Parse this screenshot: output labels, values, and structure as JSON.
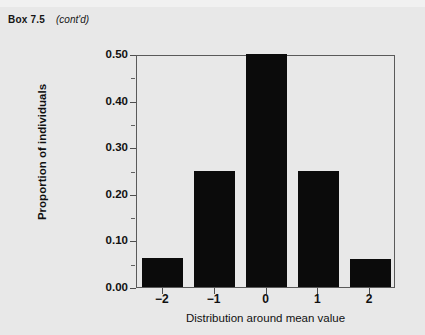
{
  "header": {
    "box_label": "Box 7.5",
    "continued": "(cont'd)"
  },
  "chart_data": {
    "type": "bar",
    "title": "",
    "subtitle": "",
    "categories": [
      "−2",
      "−1",
      "0",
      "1",
      "2"
    ],
    "values": [
      0.0625,
      0.25,
      0.5,
      0.25,
      0.06
    ],
    "xlabel": "Distribution around mean value",
    "ylabel": "Proportion of individuals",
    "ylim": [
      0.0,
      0.5
    ],
    "ytick_labels": [
      "0.00",
      "0.10",
      "0.20",
      "0.30",
      "0.40",
      "0.50"
    ],
    "ytick_values": [
      0.0,
      0.1,
      0.2,
      0.3,
      0.4,
      0.5
    ],
    "yminor_values": [
      0.05,
      0.15,
      0.25,
      0.35,
      0.45
    ],
    "grid": false,
    "legend": null,
    "bar_color": "#0b0b0b",
    "frame_color": "#5a5a5a",
    "background": "#e8e8e8"
  }
}
